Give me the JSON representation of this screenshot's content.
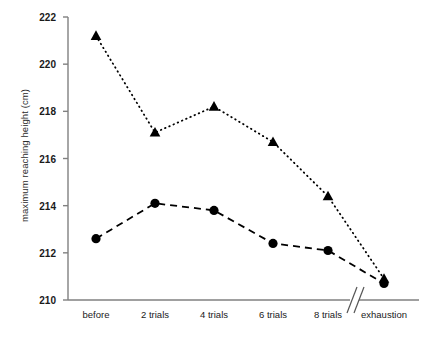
{
  "chart_data": {
    "type": "line",
    "title": "",
    "xlabel": "",
    "ylabel": "maximum reaching height (cm)",
    "categories": [
      "before",
      "2 trials",
      "4 trials",
      "6 trials",
      "8 trials",
      "exhaustion"
    ],
    "ylim": [
      210,
      222
    ],
    "yticks": [
      210,
      212,
      214,
      216,
      218,
      220,
      222
    ],
    "ytick_labels": [
      "210",
      "212",
      "214",
      "216",
      "218",
      "220",
      "222"
    ],
    "grid": false,
    "legend": "none",
    "axis_break": {
      "present": true,
      "between": [
        "8 trials",
        "exhaustion"
      ],
      "symbol": "//"
    },
    "series": [
      {
        "name": "triangle-series",
        "marker": "triangle",
        "linestyle": "dotted",
        "color": "#000000",
        "values": [
          221.2,
          217.1,
          218.2,
          216.7,
          214.4,
          210.9
        ]
      },
      {
        "name": "circle-series",
        "marker": "circle",
        "linestyle": "dashed",
        "color": "#000000",
        "values": [
          212.6,
          214.1,
          213.8,
          212.4,
          212.1,
          210.7
        ]
      }
    ]
  },
  "axes": {
    "line_color": "#808080",
    "tick_color": "#808080"
  }
}
